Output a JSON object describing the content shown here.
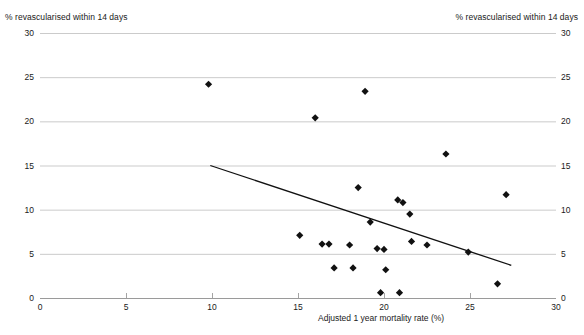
{
  "chart_data": {
    "type": "scatter",
    "title": "",
    "xlabel": "Adjusted 1 year mortality rate (%)",
    "ylabel_left": "% revascularised within 14 days",
    "ylabel_right": "% revascularised within 14 days",
    "xlim": [
      0,
      30
    ],
    "ylim": [
      0,
      30
    ],
    "xticks": [
      0,
      5,
      10,
      15,
      20,
      25,
      30
    ],
    "yticks": [
      0,
      5,
      10,
      15,
      20,
      25,
      30
    ],
    "xtick_labels": [
      "0",
      "5",
      "10",
      "15",
      "20",
      "25",
      "30"
    ],
    "ytick_labels": [
      "0",
      "5",
      "10",
      "15",
      "20",
      "25",
      "30"
    ],
    "grid": "horizontal",
    "legend": "none",
    "marker": "diamond",
    "marker_color": "#111111",
    "grid_color": "#b5b5b5",
    "axis_color": "#9a9a9a",
    "trendline_color": "#111111",
    "points": [
      {
        "x": 9.8,
        "y": 24.2
      },
      {
        "x": 18.9,
        "y": 23.4
      },
      {
        "x": 16.0,
        "y": 20.4
      },
      {
        "x": 23.6,
        "y": 16.3
      },
      {
        "x": 18.5,
        "y": 12.5
      },
      {
        "x": 27.1,
        "y": 11.7
      },
      {
        "x": 20.8,
        "y": 11.1
      },
      {
        "x": 21.1,
        "y": 10.8
      },
      {
        "x": 21.5,
        "y": 9.5
      },
      {
        "x": 19.2,
        "y": 8.6
      },
      {
        "x": 15.1,
        "y": 7.1
      },
      {
        "x": 21.6,
        "y": 6.4
      },
      {
        "x": 22.5,
        "y": 6.0
      },
      {
        "x": 16.4,
        "y": 6.1
      },
      {
        "x": 16.8,
        "y": 6.1
      },
      {
        "x": 18.0,
        "y": 6.0
      },
      {
        "x": 19.6,
        "y": 5.6
      },
      {
        "x": 20.0,
        "y": 5.5
      },
      {
        "x": 24.9,
        "y": 5.2
      },
      {
        "x": 17.1,
        "y": 3.4
      },
      {
        "x": 18.2,
        "y": 3.4
      },
      {
        "x": 20.1,
        "y": 3.2
      },
      {
        "x": 26.6,
        "y": 1.6
      },
      {
        "x": 19.8,
        "y": 0.6
      },
      {
        "x": 20.9,
        "y": 0.6
      }
    ],
    "trendline": {
      "x1": 9.9,
      "y1": 15.0,
      "x2": 27.4,
      "y2": 3.7
    }
  }
}
